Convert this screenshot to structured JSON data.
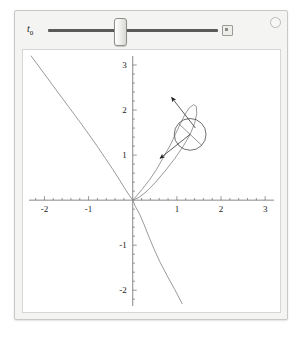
{
  "app": {
    "title": "Manipulate",
    "expander_icon": "circle-plus-icon"
  },
  "controls": {
    "slider": {
      "label_text": "t",
      "label_sub": "0",
      "name": "t0",
      "value": 0.39,
      "min": 0,
      "max": 1,
      "thumb_icon": "slider-thumb",
      "animate_button_icon": "animate-play-icon"
    }
  },
  "chart_data": {
    "type": "line",
    "title": "",
    "xlabel": "",
    "ylabel": "",
    "xlim": [
      -2.35,
      3.2
    ],
    "ylim": [
      -2.35,
      3.2
    ],
    "grid": false,
    "axes_style": "cross-at-origin",
    "x_ticks": [
      -2,
      -1,
      1,
      2,
      3
    ],
    "y_ticks": [
      -2,
      -1,
      1,
      2,
      3
    ],
    "x_tick_labels": [
      "-2",
      "-1",
      "1",
      "2",
      "3"
    ],
    "y_tick_labels": [
      "-2",
      "-1",
      "1",
      "2",
      "3"
    ],
    "minor_ticks_per_interval": 4,
    "series": [
      {
        "name": "folium-of-descartes",
        "type": "parametric-curve",
        "color": "#808080",
        "equation": "x^3 + y^3 = 3xy",
        "points": [
          [
            -2.3,
            3.2
          ],
          [
            -2.0,
            2.8
          ],
          [
            -1.7,
            2.4
          ],
          [
            -1.45,
            2.07
          ],
          [
            -1.2,
            1.74
          ],
          [
            -1.0,
            1.47
          ],
          [
            -0.8,
            1.19
          ],
          [
            -0.62,
            0.93
          ],
          [
            -0.45,
            0.68
          ],
          [
            -0.3,
            0.45
          ],
          [
            -0.18,
            0.26
          ],
          [
            -0.08,
            0.11
          ],
          [
            0.0,
            0.0
          ],
          [
            0.14,
            0.06
          ],
          [
            0.3,
            0.18
          ],
          [
            0.5,
            0.38
          ],
          [
            0.72,
            0.63
          ],
          [
            0.95,
            0.92
          ],
          [
            1.14,
            1.19
          ],
          [
            1.3,
            1.46
          ],
          [
            1.4,
            1.7
          ],
          [
            1.45,
            1.92
          ],
          [
            1.44,
            2.08
          ],
          [
            1.38,
            2.12
          ],
          [
            1.28,
            2.05
          ],
          [
            1.18,
            1.9
          ],
          [
            1.08,
            1.7
          ],
          [
            0.97,
            1.47
          ],
          [
            0.85,
            1.22
          ],
          [
            0.7,
            0.96
          ],
          [
            0.55,
            0.7
          ],
          [
            0.38,
            0.45
          ],
          [
            0.22,
            0.25
          ],
          [
            0.1,
            0.11
          ],
          [
            0.0,
            0.0
          ],
          [
            0.06,
            -0.14
          ],
          [
            0.16,
            -0.32
          ],
          [
            0.26,
            -0.55
          ],
          [
            0.36,
            -0.8
          ],
          [
            0.48,
            -1.08
          ],
          [
            0.62,
            -1.38
          ],
          [
            0.78,
            -1.68
          ],
          [
            0.95,
            -1.98
          ],
          [
            1.12,
            -2.3
          ]
        ]
      },
      {
        "name": "osculating-circle",
        "type": "circle",
        "color": "#4a4a4a",
        "center": [
          1.3,
          1.46
        ],
        "radius": 0.36
      },
      {
        "name": "radius-line",
        "type": "segment",
        "color": "#6a6a6a",
        "from": [
          1.04,
          1.7
        ],
        "to": [
          1.56,
          1.22
        ]
      },
      {
        "name": "tangent-vector-arrow",
        "type": "arrow",
        "color": "#2a2a2a",
        "from": [
          1.42,
          1.6
        ],
        "to": [
          0.88,
          2.28
        ],
        "label": ""
      },
      {
        "name": "normal-vector-arrow",
        "type": "arrow",
        "color": "#2a2a2a",
        "from": [
          1.3,
          1.46
        ],
        "to": [
          0.62,
          0.93
        ],
        "label": ""
      }
    ]
  }
}
